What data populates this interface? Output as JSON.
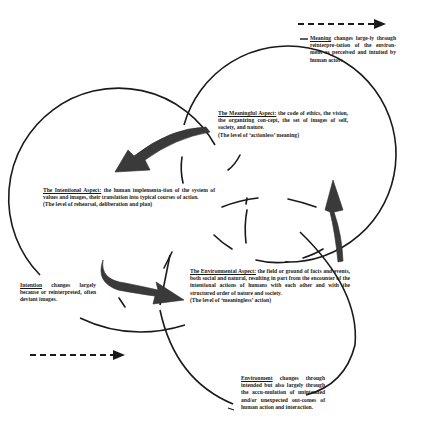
{
  "diagram": {
    "title": "",
    "nodes": {
      "meaning_note": {
        "head": "Meaning",
        "body": " changes large-ly through reinterpre-tation of the environ-ment as perceived and intuited by human actors"
      },
      "meaningful_aspect": {
        "head": "The Meaningful Aspect:",
        "body": " the code of ethics, the vision, the organizing con-cept, the set of images of self, society, and nature.",
        "level": "(The level of ‘actionless’ meaning)"
      },
      "intentional_aspect": {
        "head": "The Intentional Aspect:",
        "body": " the human implementa-tion of the system of values and images, their translation into typical courses of action.",
        "level": "(The level of rehearsal, deliberation and plan)"
      },
      "intention_note": {
        "head": "Intention",
        "body": " changes largely because or reinterpreted, often deviant images."
      },
      "environmental_aspect": {
        "head": "The Environmental Aspect:",
        "body": " the field or ground of facts and events, both social and natural, resulting in part from the encounter of the intentional actions of humans with each other and with the structured order of nature and society.",
        "level": "(The level of ‘meaningless’ action)"
      },
      "environment_note": {
        "head": "Environment",
        "body": " changes through intended but also largely through the accu-mulation of unintended and/or unexpected out-comes of human action and interaction."
      }
    },
    "arrows": [
      {
        "from": "meaningful_aspect",
        "to": "intentional_aspect",
        "style": "thick-curved"
      },
      {
        "from": "intentional_aspect",
        "to": "environmental_aspect",
        "style": "thick-curved"
      },
      {
        "from": "environmental_aspect",
        "to": "meaningful_aspect",
        "style": "thick-curved"
      },
      {
        "label": "",
        "style": "dashed-right",
        "position": "top-right"
      },
      {
        "label": "",
        "style": "dashed-right",
        "position": "bottom-left"
      }
    ],
    "colors": {
      "ink": "#1a1a1a",
      "arrow_fill": "#3a3a3a",
      "background": "#ffffff"
    }
  }
}
